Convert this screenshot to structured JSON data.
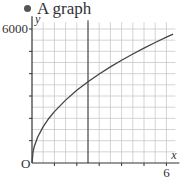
{
  "header": {
    "bullet_label": "A graph"
  },
  "chart_data": {
    "type": "line",
    "title": "A graph",
    "xlabel": "x",
    "ylabel": "y",
    "origin_label": "O",
    "xlim": [
      0,
      6.4
    ],
    "ylim": [
      0,
      6300
    ],
    "x_ticks": [
      1,
      2,
      3,
      4,
      5,
      6
    ],
    "x_tick_labels": [
      {
        "value": 6,
        "label": "6"
      }
    ],
    "y_ticks": [
      1000,
      2000,
      3000,
      4000,
      5000,
      6000
    ],
    "y_tick_labels": [
      {
        "value": 6000,
        "label": "6000"
      }
    ],
    "grid": true,
    "grid_minor_x": 0.5,
    "grid_minor_y": 500,
    "vertical_marker_x": 2.5,
    "series": [
      {
        "name": "curve",
        "x": [
          0,
          0.05,
          0.1,
          0.25,
          0.5,
          0.75,
          1,
          1.5,
          2,
          2.5,
          3,
          3.5,
          4,
          4.5,
          5,
          5.5,
          6,
          6.3
        ],
        "y": [
          0,
          514,
          727,
          1150,
          1626,
          1992,
          2300,
          2817,
          3253,
          3637,
          3984,
          4303,
          4600,
          4879,
          5143,
          5394,
          5634,
          5773
        ]
      }
    ]
  }
}
